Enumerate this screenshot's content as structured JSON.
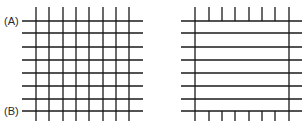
{
  "diagram": {
    "stroke_color": "#1a1a1a",
    "label_color": "#2a2a2a",
    "left_grid": {
      "label_top": "(A)",
      "label_bottom": "(B)",
      "vertical_x": [
        36,
        49,
        63,
        76,
        89,
        103,
        116,
        129
      ],
      "vertical_y_range": [
        7,
        121
      ],
      "horizontal_y": [
        21,
        33,
        47,
        60,
        73,
        86,
        99,
        111
      ],
      "horizontal_x_range": [
        22,
        143
      ]
    },
    "right_grid": {
      "frame_x": [
        195,
        289
      ],
      "frame_y_range": [
        7,
        121
      ],
      "inner_tick_x": [
        209,
        222,
        235,
        249,
        262,
        275
      ],
      "top_tick_range": [
        7,
        21
      ],
      "bottom_tick_range": [
        111,
        121
      ],
      "horizontal_y": [
        21,
        33,
        47,
        60,
        73,
        86,
        99,
        111
      ],
      "horizontal_x_range": [
        181,
        302
      ]
    }
  }
}
